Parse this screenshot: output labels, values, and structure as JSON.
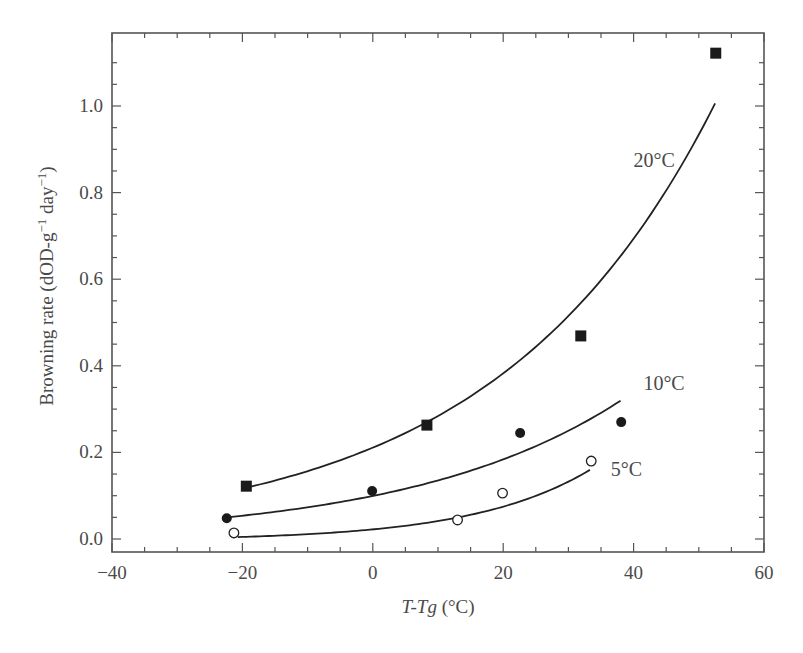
{
  "chart_data": {
    "type": "scatter",
    "title": "",
    "xlabel": "T-Tg (°C)",
    "xlabel_parts": {
      "italic": "T-Tg",
      "normal": " (°C)"
    },
    "ylabel": "Browning rate (dOD-g⁻¹ day⁻¹)",
    "xlim": [
      -40,
      60
    ],
    "ylim": [
      -0.03,
      1.15
    ],
    "x_ticks": [
      -40,
      -20,
      0,
      20,
      40,
      60
    ],
    "x_tick_labels": [
      "−40",
      "−20",
      "0",
      "20",
      "40",
      "60"
    ],
    "x_minor_step": 5,
    "y_ticks": [
      0.0,
      0.2,
      0.4,
      0.6,
      0.8,
      1.0
    ],
    "y_tick_labels": [
      "0.0",
      "0.2",
      "0.4",
      "0.6",
      "0.8",
      "1.0"
    ],
    "y_minor_step": 0.05,
    "grid": false,
    "legend": "inline labels near curve ends",
    "series": [
      {
        "name": "20°C",
        "label": "20°C",
        "marker": "filled-square",
        "x": [
          -19.4,
          8.3,
          31.9,
          52.6
        ],
        "y": [
          0.122,
          0.263,
          0.469,
          1.122
        ],
        "fit": {
          "model": "a*exp(b*x)+c",
          "a": 0.211,
          "b": 0.02975,
          "c": 0.0,
          "x_range": [
            -19,
            52.5
          ]
        },
        "label_pos": {
          "x": 40,
          "y": 0.86
        }
      },
      {
        "name": "10°C",
        "label": "10°C",
        "marker": "filled-circle",
        "x": [
          -22.4,
          -0.1,
          22.6,
          38.1
        ],
        "y": [
          0.048,
          0.111,
          0.245,
          0.27
        ],
        "fit": {
          "model": "a*exp(b*x)+c",
          "a": 0.0995,
          "b": 0.0307,
          "c": 0.0,
          "x_range": [
            -22.4,
            38
          ]
        },
        "label_pos": {
          "x": 41.5,
          "y": 0.345
        }
      },
      {
        "name": "5°C",
        "label": "5°C",
        "marker": "open-circle",
        "x": [
          -21.3,
          13.0,
          19.9,
          33.5
        ],
        "y": [
          0.014,
          0.044,
          0.106,
          0.18
        ],
        "fit": {
          "model": "a*exp(b*x)+c",
          "a": 0.0262,
          "b": 0.055,
          "c": -0.004,
          "x_range": [
            -20.7,
            33.3
          ]
        },
        "label_pos": {
          "x": 36.5,
          "y": 0.145
        }
      }
    ]
  },
  "plot_area": {
    "left": 112,
    "right": 764,
    "top": 33,
    "bottom": 552,
    "y0_px": 539,
    "y1_px": 106
  }
}
